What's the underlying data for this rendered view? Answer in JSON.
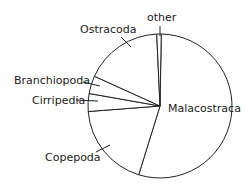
{
  "chart_data": {
    "type": "pie",
    "title": "",
    "slices": [
      {
        "label": "Malacostraca",
        "value": 54.5
      },
      {
        "label": "Copepoda",
        "value": 19.0
      },
      {
        "label": "Cirripedia",
        "value": 4.0
      },
      {
        "label": "Branchiopoda",
        "value": 4.0
      },
      {
        "label": "Ostracoda",
        "value": 17.5
      },
      {
        "label": "other",
        "value": 1.0
      }
    ],
    "start_angle_deg": 1,
    "direction": "clockwise",
    "fill": "#ffffff",
    "stroke": "#222222"
  },
  "labels": {
    "other": "other",
    "ostracoda": "Ostracoda",
    "branchiopoda": "Branchiopoda",
    "cirripedia": "Cirripedia",
    "malacostraca": "Malacostraca",
    "copepoda": "Copepoda"
  }
}
